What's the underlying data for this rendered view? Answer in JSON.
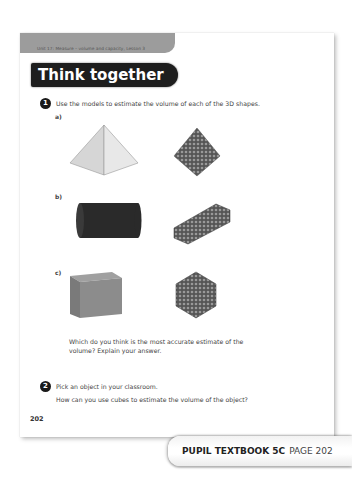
{
  "header": {
    "unit_label": "Unit 17: Measure – volume and capacity, Lesson 3"
  },
  "section_title": "Think together",
  "questions": [
    {
      "number": "1",
      "text": "Use the models to estimate the volume of each of the 3D shapes.",
      "parts": [
        {
          "label": "a)",
          "shape": "square-pyramid",
          "model": "cube-pyramid-model"
        },
        {
          "label": "b)",
          "shape": "cylinder",
          "model": "cube-cylinder-model"
        },
        {
          "label": "c)",
          "shape": "cube",
          "model": "cube-block-model"
        }
      ],
      "followup_line1": "Which do you think is the most accurate estimate of the",
      "followup_line2": "volume? Explain your answer."
    },
    {
      "number": "2",
      "text": "Pick an object in your classroom.",
      "subtext": "How can you use cubes to estimate the volume of the object?"
    }
  ],
  "page_number": "202",
  "footer_tab": {
    "book": "PUPIL TEXTBOOK 5C",
    "page": "PAGE 202"
  },
  "colors": {
    "band": "#9c9c9c",
    "title_bg": "#1e1e1e",
    "pyramid_light": "#e0e0e0",
    "cylinder": "#2a2a2a",
    "cube_grey": "#8a8a8a"
  }
}
